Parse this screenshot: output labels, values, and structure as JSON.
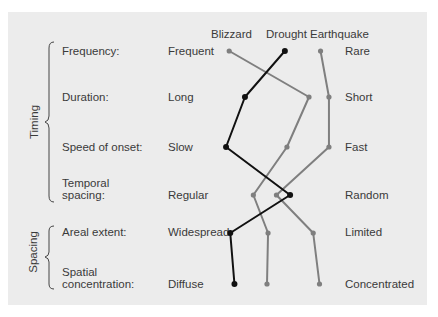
{
  "chart_data": {
    "type": "line",
    "title": "",
    "series_labels_position": "top",
    "groups": [
      {
        "label": "Timing",
        "rows": [
          "Frequency:",
          "Duration:",
          "Speed of onset:",
          "Temporal spacing:"
        ]
      },
      {
        "label": "Spacing",
        "rows": [
          "Areal extent:",
          "Spatial concentration:"
        ]
      }
    ],
    "rows": [
      {
        "attribute": "Frequency:",
        "left": "Frequent",
        "right": "Rare"
      },
      {
        "attribute": "Duration:",
        "left": "Long",
        "right": "Short"
      },
      {
        "attribute": "Speed of onset:",
        "left": "Slow",
        "right": "Fast"
      },
      {
        "attribute": "Temporal spacing:",
        "left": "Regular",
        "right": "Random"
      },
      {
        "attribute": "Areal extent:",
        "left": "Widespread",
        "right": "Limited"
      },
      {
        "attribute": "Spatial concentration:",
        "left": "Diffuse",
        "right": "Concentrated"
      }
    ],
    "scale_note": "0 = left pole, 1 = right pole (estimated from marker positions)",
    "series": [
      {
        "name": "Blizzard",
        "color": "#7f7f7f",
        "values": [
          0.04,
          0.8,
          0.59,
          0.27,
          0.41,
          0.4
        ]
      },
      {
        "name": "Drought",
        "color": "#111111",
        "values": [
          0.57,
          0.19,
          0.01,
          0.62,
          0.05,
          0.09
        ]
      },
      {
        "name": "Earthquake",
        "color": "#7f7f7f",
        "values": [
          0.91,
          0.99,
          0.99,
          0.49,
          0.84,
          0.9
        ]
      }
    ]
  },
  "headers": {
    "blizzard": "Blizzard",
    "drought": "Drought",
    "earthquake": "Earthquake"
  },
  "group_labels": {
    "timing": "Timing",
    "spacing": "Spacing"
  },
  "rows": {
    "frequency": {
      "label": "Frequency:",
      "left": "Frequent",
      "right": "Rare"
    },
    "duration": {
      "label": "Duration:",
      "left": "Long",
      "right": "Short"
    },
    "speed": {
      "label": "Speed of onset:",
      "left": "Slow",
      "right": "Fast"
    },
    "temporal": {
      "label1": "Temporal",
      "label2": "spacing:",
      "left": "Regular",
      "right": "Random"
    },
    "areal": {
      "label": "Areal extent:",
      "left": "Widespread",
      "right": "Limited"
    },
    "spatial": {
      "label1": "Spatial",
      "label2": "concentration:",
      "left": "Diffuse",
      "right": "Concentrated"
    }
  }
}
